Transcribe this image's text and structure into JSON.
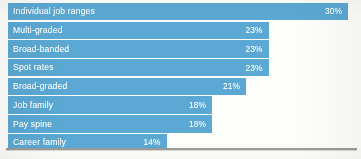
{
  "chart_data": {
    "type": "bar",
    "orientation": "horizontal",
    "title": "",
    "subtitle": "",
    "xlabel": "",
    "ylabel": "",
    "xlim": [
      0,
      30
    ],
    "grid": false,
    "legend": null,
    "value_suffix": "%",
    "bar_color": "#5aa8d3",
    "label_color": "#ffffff",
    "categories": [
      "Individual job ranges",
      "Multi-graded",
      "Broad-banded",
      "Spot rates",
      "Broad-graded",
      "Job family",
      "Pay spine",
      "Career family"
    ],
    "values": [
      30,
      23,
      23,
      23,
      21,
      18,
      18,
      14
    ],
    "value_labels": [
      "30%",
      "23%",
      "23%",
      "23%",
      "21%",
      "18%",
      "18%",
      "14%"
    ]
  }
}
